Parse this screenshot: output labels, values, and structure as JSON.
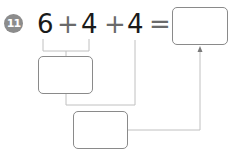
{
  "problem": {
    "number": "11",
    "expression": {
      "terms": [
        "6",
        "+",
        "4",
        "+",
        "4",
        "="
      ]
    },
    "boxes": [
      {
        "id": "result-box",
        "value": ""
      },
      {
        "id": "partial-sum-box",
        "value": ""
      },
      {
        "id": "second-sum-box",
        "value": ""
      }
    ]
  },
  "colors": {
    "badge": "#8c8c8c",
    "lines": "#b5b5b5",
    "box_border": "#8a8a8a"
  }
}
